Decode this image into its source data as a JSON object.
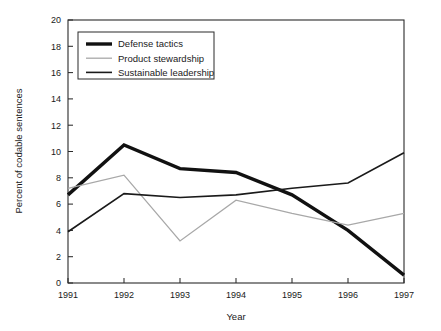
{
  "chart_data": {
    "type": "line",
    "title": "",
    "xlabel": "Year",
    "ylabel": "Percent of codable sentences",
    "categories": [
      "1991",
      "1992",
      "1993",
      "1994",
      "1995",
      "1996",
      "1997"
    ],
    "x": [
      1991,
      1992,
      1993,
      1994,
      1995,
      1996,
      1997
    ],
    "xlim": [
      1991,
      1997
    ],
    "ylim": [
      0,
      20
    ],
    "yticks": [
      0,
      2,
      4,
      6,
      8,
      10,
      12,
      14,
      16,
      18,
      20
    ],
    "ytick_labels": [
      "0",
      "2",
      "4",
      "6",
      "8",
      "10",
      "12",
      "14",
      "16",
      "18",
      "20"
    ],
    "grid": false,
    "legend_position": "top-left",
    "series": [
      {
        "name": "Defense tactics",
        "values": [
          6.7,
          10.5,
          8.7,
          8.4,
          6.7,
          4.0,
          0.6
        ],
        "color": "#111111",
        "width": 3.4
      },
      {
        "name": "Product stewardship",
        "values": [
          7.2,
          8.2,
          3.2,
          6.3,
          5.3,
          4.4,
          5.3
        ],
        "color": "#a8a8a8",
        "width": 1.3
      },
      {
        "name": "Sustainable leadership",
        "values": [
          3.9,
          6.8,
          6.5,
          6.7,
          7.2,
          7.6,
          9.9
        ],
        "color": "#1a1a1a",
        "width": 1.6
      }
    ]
  },
  "axes": {
    "y_title": "Percent of codable sentences",
    "x_title": "Year",
    "y_tick_labels": [
      "20",
      "18",
      "16",
      "14",
      "12",
      "10",
      "8",
      "6",
      "4",
      "2",
      "0"
    ],
    "x_tick_labels": [
      "1991",
      "1992",
      "1993",
      "1994",
      "1995",
      "1996",
      "1997"
    ]
  },
  "legend": {
    "entries": [
      {
        "label": "Defense tactics",
        "color": "#111111",
        "width": 3.4
      },
      {
        "label": "Product stewardship",
        "color": "#a8a8a8",
        "width": 1.3
      },
      {
        "label": "Sustainable leadership",
        "color": "#1a1a1a",
        "width": 1.6
      }
    ]
  }
}
